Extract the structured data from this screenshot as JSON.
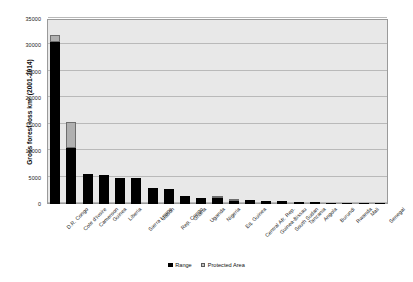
{
  "chart_data": {
    "type": "bar",
    "stacked": true,
    "title": "",
    "xlabel": "",
    "ylabel": "Gross forest loss km² (2001-2014)",
    "ylim": [
      0,
      35000
    ],
    "ytick_step": 5000,
    "yticks": [
      "0",
      "5000",
      "10000",
      "15000",
      "20000",
      "25000",
      "30000",
      "35000"
    ],
    "grid": true,
    "legend_position": "bottom-center",
    "categories": [
      "D.R. Congo",
      "Cote d'Ivoire",
      "Cameroon",
      "Guinea",
      "Liberia",
      "Sierra Leone",
      "Gabon",
      "Rep. Congo",
      "Ghana",
      "Uganda",
      "Nigeria",
      "Eq. Guinea",
      "Central Afr. Rep.",
      "Guinea-Bissau",
      "South Sudan",
      "Tanzania",
      "Angola",
      "Burundi",
      "Rwanda",
      "Mali",
      "Senegal"
    ],
    "series": [
      {
        "name": "Range",
        "color": "#000000",
        "values": [
          30700,
          10600,
          5700,
          5500,
          5000,
          4900,
          3000,
          2900,
          1500,
          1200,
          1100,
          700,
          800,
          600,
          500,
          400,
          350,
          250,
          200,
          150,
          100
        ]
      },
      {
        "name": "Protected Area",
        "color": "#b0b0b0",
        "values": [
          1300,
          5000,
          0,
          0,
          0,
          0,
          0,
          0,
          0,
          0,
          400,
          300,
          0,
          0,
          0,
          0,
          0,
          0,
          0,
          0,
          0
        ]
      }
    ],
    "legend": [
      {
        "label": "Range",
        "swatch": "black-square"
      },
      {
        "label": "Protected Area",
        "swatch": "light-gray-square"
      }
    ],
    "colors": {
      "plot_background": "#e8e8e8",
      "gridline": "#b9b9b9",
      "axis_border": "#9a9a9a",
      "range": "#000000",
      "protected_area": "#b0b0b0",
      "page_background": "#ffffff"
    }
  }
}
